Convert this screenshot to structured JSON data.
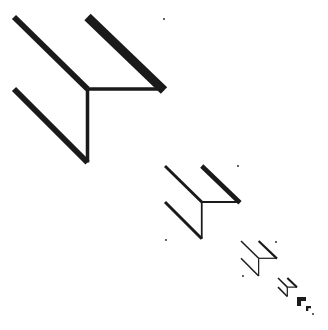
{
  "figure": {
    "description": "Recursive series of isometric open-corner shapes diminishing along the diagonal",
    "background_color": "#ffffff",
    "ink_color": "#1a1a1a",
    "shapes": [
      {
        "id": "corner-1",
        "x": 14,
        "y": 17,
        "size": 150
      },
      {
        "id": "corner-2",
        "x": 165,
        "y": 166,
        "size": 75
      },
      {
        "id": "corner-3",
        "x": 241,
        "y": 241,
        "size": 36
      },
      {
        "id": "corner-4",
        "x": 278,
        "y": 278,
        "size": 19
      },
      {
        "id": "corner-5",
        "x": 297,
        "y": 297,
        "size": 9
      },
      {
        "id": "corner-6",
        "x": 306,
        "y": 306,
        "size": 5
      }
    ],
    "dots": [
      {
        "x": 164,
        "y": 19
      },
      {
        "x": 238,
        "y": 166
      },
      {
        "x": 166,
        "y": 240
      },
      {
        "x": 276,
        "y": 242
      },
      {
        "x": 243,
        "y": 276
      },
      {
        "x": 313,
        "y": 314
      }
    ]
  }
}
